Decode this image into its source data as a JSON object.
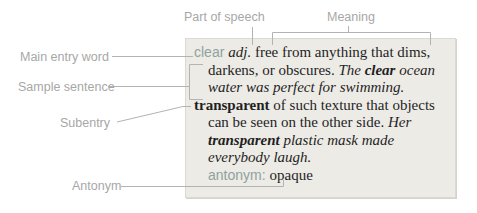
{
  "colors": {
    "accent_teal": "#8fa2a0",
    "label_gray": "#a7a7a7",
    "line_gray": "#b3b3b3",
    "box_background": "#edebe6",
    "body_text": "#1f1f1f"
  },
  "callouts": {
    "part_of_speech": "Part of speech",
    "meaning": "Meaning",
    "main_entry_word": "Main entry word",
    "sample_sentence": "Sample sentence",
    "subentry": "Subentry",
    "antonym": "Antonym"
  },
  "entry": {
    "headword": "clear",
    "part_of_speech": "adj.",
    "definition_1": "free from anything that dims, darkens, or obscures.",
    "sample_sentence_1": "The clear ocean water was perfect for swimming.",
    "subentry_word": "transparent",
    "definition_2": "of such texture that objects can be seen on the other side.",
    "sample_sentence_2": "Her transparent plastic mask made everybody laugh.",
    "antonym_label": "antonym:",
    "antonym_value": "opaque",
    "lines": [
      {
        "indent": false,
        "segments": [
          {
            "text": "clear ",
            "role": "entry-word"
          },
          {
            "text": "adj. ",
            "role": "pos"
          },
          {
            "text": "free from anything that dims,",
            "role": "def"
          }
        ]
      },
      {
        "indent": true,
        "segments": [
          {
            "text": "darkens, or obscures. ",
            "role": "def"
          },
          {
            "text": "The ",
            "role": "sample"
          },
          {
            "text": "clear",
            "role": "sample-word"
          },
          {
            "text": " ocean",
            "role": "sample"
          }
        ]
      },
      {
        "indent": true,
        "segments": [
          {
            "text": "water was perfect for swimming.",
            "role": "sample"
          }
        ]
      },
      {
        "indent": false,
        "segments": [
          {
            "text": "transparent ",
            "role": "subentry-word"
          },
          {
            "text": "of such texture that objects",
            "role": "def"
          }
        ]
      },
      {
        "indent": true,
        "segments": [
          {
            "text": "can be seen on the other side. ",
            "role": "def"
          },
          {
            "text": "Her",
            "role": "sample"
          }
        ]
      },
      {
        "indent": true,
        "segments": [
          {
            "text": "transparent ",
            "role": "sample-word"
          },
          {
            "text": "plastic mask made",
            "role": "sample"
          }
        ]
      },
      {
        "indent": true,
        "segments": [
          {
            "text": "everybody laugh.",
            "role": "sample"
          }
        ]
      },
      {
        "indent": true,
        "segments": [
          {
            "text": "antonym: ",
            "role": "antonym-label"
          },
          {
            "text": "opaque",
            "role": "antonym-word"
          }
        ]
      }
    ]
  }
}
